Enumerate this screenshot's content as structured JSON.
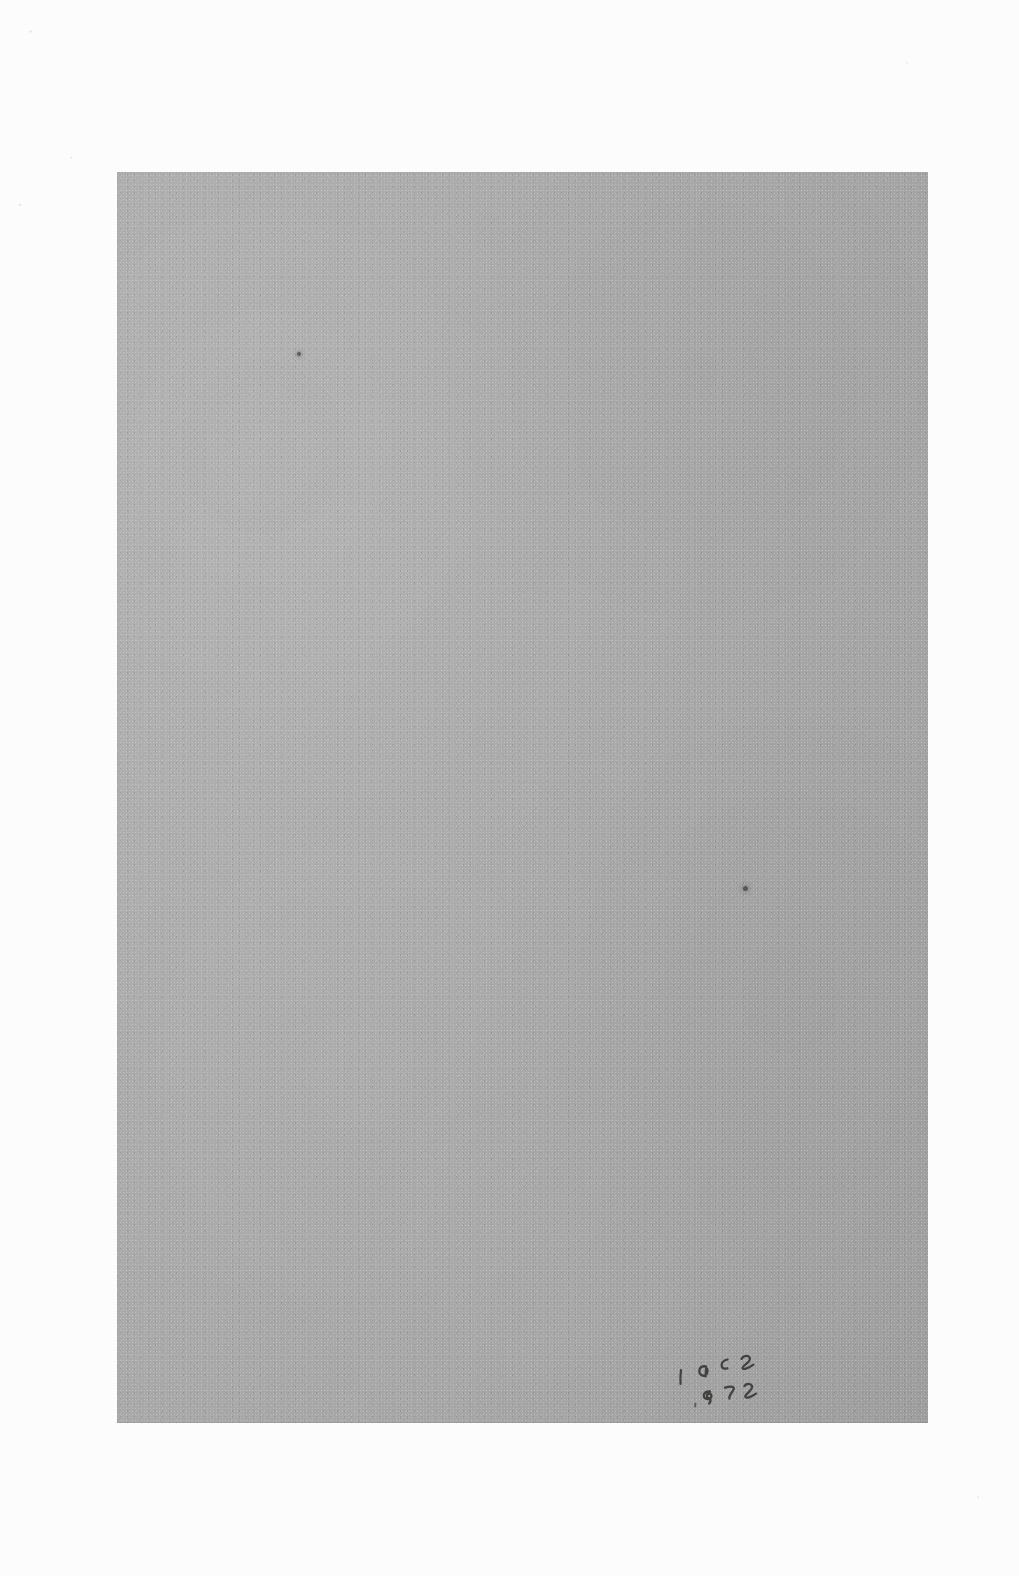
{
  "document": {
    "type": "scanned-page",
    "title": "Blank gray page scan",
    "page_body_text": "",
    "surround_color": "#fcfcfd",
    "paper_color": "#a9a9a9"
  },
  "page": {
    "left": 117,
    "top": 172,
    "width": 811,
    "height": 1251
  },
  "annotations": {
    "handwriting": {
      "name": "pencil-inscription",
      "medium": "pencil",
      "color": "#2e2c29",
      "lines": [
        {
          "text": "1952"
        },
        {
          "text": "1872"
        }
      ],
      "transcription": "1952 1872",
      "position": "bottom-right"
    },
    "specks": [
      {
        "name": "speck-upper-left",
        "x": 180,
        "y": 180
      },
      {
        "name": "speck-lower-right",
        "x": 626,
        "y": 714
      }
    ]
  }
}
